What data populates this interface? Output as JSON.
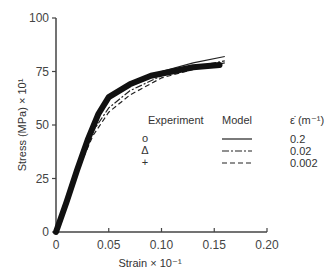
{
  "chart_data": {
    "type": "line",
    "title": "",
    "xlabel": "Strain × 10⁻¹",
    "ylabel": "Stress (MPa) × 10¹",
    "xlim": [
      0,
      0.2
    ],
    "ylim": [
      0,
      100
    ],
    "xticks": [
      "0",
      "0.05",
      "0.10",
      "0.15",
      "0.20"
    ],
    "yticks": [
      "0",
      "25",
      "50",
      "75",
      "100"
    ],
    "grid": false,
    "legend_position": "center-right",
    "legend": {
      "col_experiment": "Experiment",
      "col_model": "Model",
      "col_rate": "ε̇ (m⁻¹)",
      "rows": [
        {
          "marker": "o",
          "line": "solid",
          "rate": "0.2"
        },
        {
          "marker": "Δ",
          "line": "dash-dot",
          "rate": "0.02"
        },
        {
          "marker": "+",
          "line": "dashed",
          "rate": "0.002"
        }
      ]
    },
    "series": [
      {
        "name": "Model ε̇=0.2",
        "style": "solid",
        "x": [
          0,
          0.02,
          0.035,
          0.05,
          0.07,
          0.1,
          0.13,
          0.16
        ],
        "y": [
          0,
          30,
          50,
          63,
          70,
          75,
          79,
          82
        ]
      },
      {
        "name": "Model ε̇=0.02",
        "style": "dash-dot",
        "x": [
          0,
          0.02,
          0.035,
          0.05,
          0.07,
          0.1,
          0.13,
          0.16
        ],
        "y": [
          0,
          29,
          47,
          58,
          66,
          73,
          77,
          80
        ]
      },
      {
        "name": "Model ε̇=0.002",
        "style": "dashed",
        "x": [
          0,
          0.02,
          0.035,
          0.05,
          0.07,
          0.1,
          0.13,
          0.16
        ],
        "y": [
          0,
          28,
          45,
          56,
          64,
          72,
          76,
          79
        ]
      },
      {
        "name": "Experiment",
        "style": "markers",
        "x": [
          0,
          0.01,
          0.02,
          0.03,
          0.04,
          0.05,
          0.07,
          0.09,
          0.11,
          0.13,
          0.155
        ],
        "y": [
          0,
          14,
          29,
          43,
          55,
          63,
          69,
          73,
          75,
          77,
          78
        ]
      }
    ]
  }
}
